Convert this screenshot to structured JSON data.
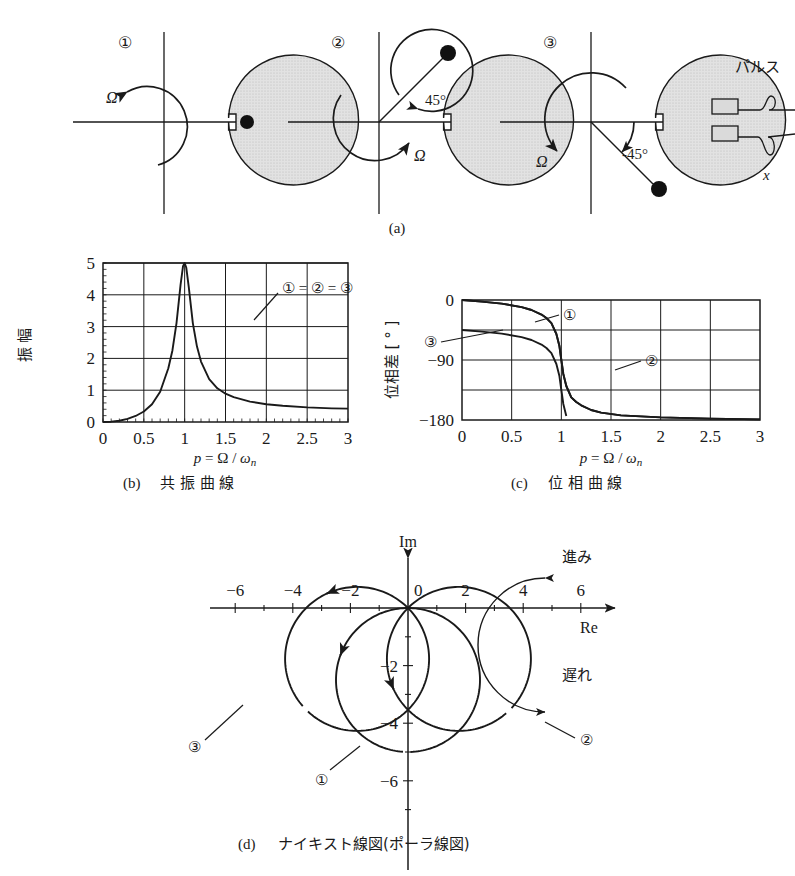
{
  "figure": {
    "panels": [
      {
        "id": "a",
        "caption": "(a)"
      },
      {
        "id": "b",
        "caption": "(b)",
        "title": "共 振 曲 線"
      },
      {
        "id": "c",
        "caption": "(c)",
        "title": "位 相 曲 線"
      },
      {
        "id": "d",
        "caption": "(d)",
        "title": "ナイキスト線図(ポーラ線図)"
      }
    ]
  },
  "panel_a": {
    "disks": [
      {
        "index": "①",
        "omega_label": "Ω",
        "mass_angle_deg": 0,
        "angle_label": "",
        "spin_dir": "ccw"
      },
      {
        "index": "②",
        "omega_label": "Ω",
        "mass_angle_deg": 45,
        "angle_label": "45°",
        "spin_dir": "ccw"
      },
      {
        "index": "③",
        "omega_label": "Ω",
        "mass_angle_deg": -45,
        "angle_label": "-45°",
        "spin_dir": "cw"
      }
    ],
    "sensor": {
      "pulse_label": "パルス",
      "displacement_label": "x"
    }
  },
  "chart_data": [
    {
      "id": "b",
      "type": "line",
      "title": "共 振 曲 線",
      "caption": "(b)",
      "xlabel": "p = Ω / ωₙ",
      "ylabel": "振 幅",
      "xlim": [
        0,
        3
      ],
      "ylim": [
        0,
        5
      ],
      "xticks": [
        "0",
        "0.5",
        "1",
        "1.5",
        "2",
        "2.5",
        "3"
      ],
      "yticks": [
        "0",
        "1",
        "2",
        "3",
        "4",
        "5"
      ],
      "grid": true,
      "annotation": "① = ② = ③",
      "series": [
        {
          "name": "① = ② = ③",
          "zeta": 0.1,
          "x": [
            0,
            0.1,
            0.2,
            0.3,
            0.4,
            0.5,
            0.6,
            0.7,
            0.8,
            0.85,
            0.9,
            0.95,
            0.98,
            1.0,
            1.02,
            1.05,
            1.1,
            1.15,
            1.2,
            1.3,
            1.4,
            1.5,
            1.6,
            1.8,
            2.0,
            2.2,
            2.5,
            2.8,
            3.0
          ],
          "values": [
            0.0,
            0.01,
            0.04,
            0.1,
            0.19,
            0.33,
            0.56,
            0.95,
            1.69,
            2.25,
            3.11,
            4.32,
            4.9,
            5.0,
            4.85,
            4.25,
            3.11,
            2.38,
            1.9,
            1.35,
            1.06,
            0.89,
            0.78,
            0.64,
            0.56,
            0.51,
            0.46,
            0.43,
            0.42
          ]
        }
      ]
    },
    {
      "id": "c",
      "type": "line",
      "title": "位 相 曲 線",
      "caption": "(c)",
      "xlabel": "p = Ω / ωₙ",
      "ylabel": "位相差 [ ° ]",
      "xlim": [
        0,
        3
      ],
      "ylim": [
        -180,
        0
      ],
      "xticks": [
        "0",
        "0.5",
        "1",
        "1.5",
        "2",
        "2.5",
        "3"
      ],
      "yticks": [
        "0",
        "−90",
        "−180"
      ],
      "grid": true,
      "series": [
        {
          "name": "①",
          "offset_deg": 0,
          "x": [
            0,
            0.2,
            0.4,
            0.6,
            0.7,
            0.8,
            0.85,
            0.9,
            0.95,
            0.98,
            1.0,
            1.02,
            1.05,
            1.1,
            1.15,
            1.2,
            1.3,
            1.4,
            1.6,
            2.0,
            2.5,
            3.0
          ],
          "values": [
            0,
            -2.4,
            -5.4,
            -10.7,
            -15.0,
            -21.8,
            -27.0,
            -34.6,
            -51.0,
            -68.6,
            -90,
            -111,
            -129,
            -146,
            -153,
            -158,
            -165,
            -169,
            -173,
            -176,
            -178,
            -179
          ]
        },
        {
          "name": "②",
          "offset_deg": 45,
          "x": [
            0,
            0.2,
            0.4,
            0.6,
            0.7,
            0.8,
            0.85,
            0.9,
            0.95,
            0.98,
            1.0,
            1.02,
            1.05,
            1.1,
            1.15,
            1.2,
            1.3,
            1.4,
            1.6,
            2.0,
            2.5,
            3.0
          ],
          "values": [
            0,
            -2.4,
            -5.4,
            -10.7,
            -15.0,
            -21.8,
            -27.0,
            -34.6,
            -51.0,
            -68.6,
            -90,
            -111,
            -129,
            -146,
            -153,
            -158,
            -165,
            -169,
            -173,
            -176,
            -178,
            -179
          ]
        },
        {
          "name": "③",
          "offset_deg": -45,
          "x": [
            0,
            0.2,
            0.4,
            0.6,
            0.7,
            0.8,
            0.85,
            0.9,
            0.95,
            0.98,
            1.0,
            1.02,
            1.05,
            1.1,
            1.15,
            1.2,
            1.3,
            1.4,
            1.6,
            2.0,
            2.5,
            3.0
          ],
          "values": [
            -45,
            -47.4,
            -50.4,
            -55.7,
            -60.0,
            -66.8,
            -72.0,
            -79.6,
            -96.0,
            -113.6,
            -135,
            -156,
            -174,
            -191,
            -198,
            -203,
            -210,
            -214,
            -218,
            -221,
            -223,
            -224
          ]
        }
      ]
    },
    {
      "id": "d",
      "type": "line",
      "title": "ナイキスト線図(ポーラ線図)",
      "caption": "(d)",
      "xlabel": "Re",
      "ylabel": "Im",
      "xlim": [
        -7,
        7
      ],
      "ylim": [
        -7.2,
        1.5
      ],
      "xticks": [
        "−6",
        "−4",
        "−2",
        "0",
        "2",
        "4",
        "6"
      ],
      "yticks": [
        "−2",
        "−4",
        "−6"
      ],
      "grid": false,
      "lead_label": "進み",
      "lag_label": "遅れ",
      "series": [
        {
          "name": "①",
          "rotation_deg": 0,
          "center": [
            0,
            -2.5
          ],
          "radius": 2.5
        },
        {
          "name": "②",
          "rotation_deg": 45,
          "center": [
            1.77,
            -1.77
          ],
          "radius": 2.5
        },
        {
          "name": "③",
          "rotation_deg": -45,
          "center": [
            -1.77,
            -1.77
          ],
          "radius": 2.5
        }
      ]
    }
  ]
}
